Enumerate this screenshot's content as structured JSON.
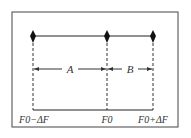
{
  "diagram": {
    "labels": {
      "left": "F0−ΔF",
      "center": "F0",
      "right": "F0+ΔF",
      "span_a": "A",
      "span_b": "B"
    },
    "points": [
      {
        "name": "F0-dF",
        "x": 33
      },
      {
        "name": "F0",
        "x": 107
      },
      {
        "name": "F0+dF",
        "x": 153
      }
    ],
    "colors": {
      "line": "#222222",
      "frame": "#444444"
    }
  }
}
